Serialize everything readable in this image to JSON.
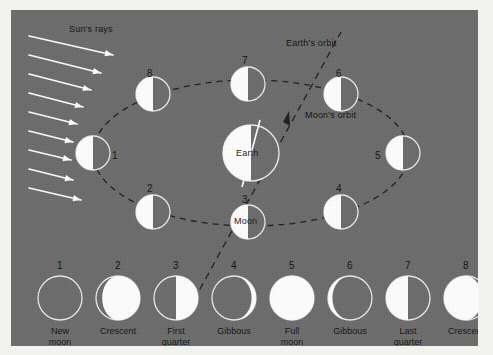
{
  "diagram": {
    "background_color": "#6b6b6b",
    "lit_color": "#ffffff",
    "dark_color": "#6b6b6b",
    "outline_color": "#e8e8e8",
    "text_color": "#141414"
  },
  "labels": {
    "suns_rays": "Sun's rays",
    "earths_orbit": "Earth's orbit",
    "moons_orbit": "Moon's orbit",
    "earth": "Earth",
    "moon": "Moon"
  },
  "orbit": {
    "center": {
      "x": 240,
      "y": 143
    },
    "radius_x": 158,
    "radius_y": 73,
    "positions": [
      {
        "num": "1",
        "cx": 82,
        "cy": 143,
        "label_x": 101,
        "label_y": 140,
        "lit": "left-half"
      },
      {
        "num": "2",
        "cx": 142,
        "cy": 202,
        "label_x": 136,
        "label_y": 173,
        "lit": "left-half"
      },
      {
        "num": "3",
        "cx": 237,
        "cy": 212,
        "label_x": 231,
        "label_y": 184,
        "lit": "left-half"
      },
      {
        "num": "4",
        "cx": 330,
        "cy": 202,
        "label_x": 325,
        "label_y": 173,
        "lit": "left-half"
      },
      {
        "num": "5",
        "cx": 392,
        "cy": 143,
        "label_x": 364,
        "label_y": 140,
        "lit": "left-half"
      },
      {
        "num": "6",
        "cx": 330,
        "cy": 84,
        "label_x": 325,
        "label_y": 58,
        "lit": "left-half"
      },
      {
        "num": "7",
        "cx": 237,
        "cy": 74,
        "label_x": 231,
        "label_y": 45,
        "lit": "left-half"
      },
      {
        "num": "8",
        "cx": 142,
        "cy": 84,
        "label_x": 136,
        "label_y": 58,
        "lit": "left-half"
      }
    ],
    "earth_body": {
      "cx": 240,
      "cy": 143,
      "r": 28
    },
    "moon_body_at_3": {
      "cx": 237,
      "cy": 212,
      "r": 17
    }
  },
  "suns_rays": {
    "arrow_count": 9,
    "direction": "right-and-down",
    "arrows": [
      {
        "x1": 18,
        "y1": 26,
        "x2": 102,
        "y2": 45
      },
      {
        "x1": 18,
        "y1": 45,
        "x2": 90,
        "y2": 63
      },
      {
        "x1": 18,
        "y1": 64,
        "x2": 80,
        "y2": 80
      },
      {
        "x1": 18,
        "y1": 83,
        "x2": 72,
        "y2": 97
      },
      {
        "x1": 18,
        "y1": 102,
        "x2": 66,
        "y2": 114
      },
      {
        "x1": 18,
        "y1": 121,
        "x2": 62,
        "y2": 132
      },
      {
        "x1": 18,
        "y1": 140,
        "x2": 60,
        "y2": 150
      },
      {
        "x1": 18,
        "y1": 159,
        "x2": 62,
        "y2": 170
      },
      {
        "x1": 18,
        "y1": 178,
        "x2": 70,
        "y2": 190
      }
    ]
  },
  "phase_strip": {
    "circle_radius": 22,
    "baseline_y": 288,
    "items": [
      {
        "num": "1",
        "name": "New\nmoon",
        "name_line1": "New",
        "name_line2": "moon",
        "cx": 49,
        "phase": "new"
      },
      {
        "num": "2",
        "name": "Crescent",
        "name_line1": "Crescent",
        "name_line2": "",
        "cx": 107,
        "phase": "waxing-crescent"
      },
      {
        "num": "3",
        "name": "First\nquarter",
        "name_line1": "First",
        "name_line2": "quarter",
        "cx": 165,
        "phase": "first-quarter"
      },
      {
        "num": "4",
        "name": "Gibbous",
        "name_line1": "Gibbous",
        "name_line2": "",
        "cx": 223,
        "phase": "waxing-gibbous"
      },
      {
        "num": "5",
        "name": "Full\nmoon",
        "name_line1": "Full",
        "name_line2": "moon",
        "cx": 281,
        "phase": "full"
      },
      {
        "num": "6",
        "name": "Gibbous",
        "name_line1": "Gibbous",
        "name_line2": "",
        "cx": 339,
        "phase": "waning-gibbous"
      },
      {
        "num": "7",
        "name": "Last\nquarter",
        "name_line1": "Last",
        "name_line2": "quarter",
        "cx": 397,
        "phase": "last-quarter"
      },
      {
        "num": "8",
        "name": "Crescent",
        "name_line1": "Crescent",
        "name_line2": "",
        "cx": 455,
        "phase": "waning-crescent"
      }
    ]
  }
}
